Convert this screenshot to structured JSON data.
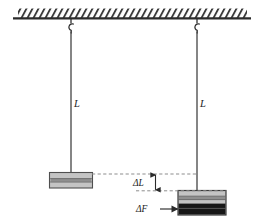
{
  "figure": {
    "type": "physics-diagram",
    "colors": {
      "ink": "#2b2b2b",
      "block_fill": "#b7b7b7",
      "block_fill_light": "#c9c9c9",
      "block_dark": "#1a1a1a",
      "ceiling_hatch": "#333333",
      "dashed": "#8d8d8d",
      "background": "#ffffff"
    }
  },
  "ceiling": {
    "name": "hatched support ceiling",
    "hatch_count": 60
  },
  "supports": [
    {
      "name": "left-hook",
      "x": 71
    },
    {
      "name": "right-hook",
      "x": 197
    }
  ],
  "wires": [
    {
      "name": "left-wire",
      "label": "L",
      "label_x": 74,
      "label_y": 104
    },
    {
      "name": "right-wire",
      "label": "L",
      "label_x": 200,
      "label_y": 104
    }
  ],
  "blocks": {
    "left": {
      "name": "unloaded-block",
      "has_dark_band": false
    },
    "right": {
      "name": "loaded-block",
      "has_dark_band": true
    }
  },
  "annotations": {
    "delta_l": {
      "label": "ΔL",
      "x": 141,
      "y": 182
    },
    "delta_f": {
      "label": "ΔF",
      "x": 144,
      "y": 209
    }
  }
}
